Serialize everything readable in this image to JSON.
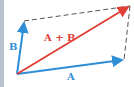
{
  "diagram": {
    "colors": {
      "vector": "#2f8fd6",
      "resultant": "#e0403a",
      "dashed": "#555555",
      "border": "#b9c3cf"
    },
    "points": {
      "origin": [
        17,
        74
      ],
      "a_tip": [
        124,
        60
      ],
      "b_tip": [
        24,
        21
      ],
      "sum_tip": [
        130,
        6
      ]
    },
    "labels": {
      "a": "A",
      "b": "B",
      "sum": "A + B"
    }
  }
}
